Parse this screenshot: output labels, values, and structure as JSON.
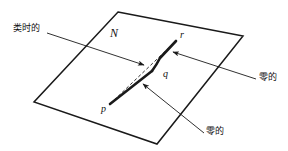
{
  "figure": {
    "type": "spacetime-geometry-diagram",
    "background_color": "#ffffff",
    "stroke_color": "#1a1a1a",
    "surface_label": "N",
    "points": [
      {
        "id": "p",
        "label": "p",
        "x": 110,
        "y": 104
      },
      {
        "id": "q",
        "label": "q",
        "x": 152,
        "y": 71
      },
      {
        "id": "r",
        "label": "r",
        "x": 176,
        "y": 41
      }
    ],
    "point_text_positions": [
      {
        "id": "p",
        "label": "p",
        "x": 101,
        "y": 110
      },
      {
        "id": "q",
        "label": "q",
        "x": 163,
        "y": 75
      },
      {
        "id": "r",
        "label": "r",
        "x": 180,
        "y": 36
      }
    ],
    "surface_label_position": {
      "x": 110,
      "y": 33
    },
    "annotations": [
      {
        "id": "timelike",
        "label": "类时的",
        "meaning": "timelike",
        "text_x": 13,
        "text_y": 29,
        "leader_from": {
          "x": 47,
          "y": 33
        },
        "leader_to": {
          "x": 144,
          "y": 65
        }
      },
      {
        "id": "null-right",
        "label": "零的",
        "meaning": "null",
        "text_x": 259,
        "text_y": 78,
        "leader_from": {
          "x": 256,
          "y": 79
        },
        "leader_to": {
          "x": 173,
          "y": 52
        }
      },
      {
        "id": "null-bottom",
        "label": "零的",
        "meaning": "null",
        "text_x": 206,
        "text_y": 132,
        "leader_from": {
          "x": 204,
          "y": 133
        },
        "leader_to": {
          "x": 143,
          "y": 84
        }
      }
    ],
    "surface_polygon": [
      {
        "x": 118,
        "y": 12
      },
      {
        "x": 243,
        "y": 36
      },
      {
        "x": 157,
        "y": 144
      },
      {
        "x": 34,
        "y": 102
      }
    ],
    "paths": [
      {
        "id": "null-geodesic-pqr",
        "style": "solid-thick",
        "description": "broken null path from p through q to r",
        "points": [
          {
            "x": 110,
            "y": 104
          },
          {
            "x": 152,
            "y": 71
          },
          {
            "x": 158,
            "y": 62
          },
          {
            "x": 176,
            "y": 41
          }
        ]
      },
      {
        "id": "timelike-geodesic-pr",
        "style": "dashed",
        "description": "dashed timelike curve from p to r",
        "points": [
          {
            "x": 110,
            "y": 104
          },
          {
            "x": 176,
            "y": 41
          }
        ]
      }
    ]
  }
}
